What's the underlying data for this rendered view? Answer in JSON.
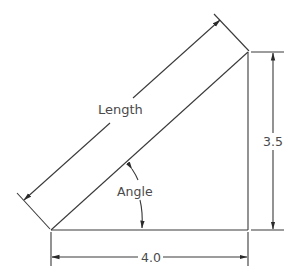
{
  "diagram": {
    "type": "right-triangle-dimension-drawing",
    "labels": {
      "hypotenuse": "Length",
      "angle": "Angle",
      "height": "3.5",
      "base": "4.0"
    },
    "colors": {
      "line": "#3a3a3a",
      "text": "#4a4a4a",
      "background": "#ffffff"
    }
  }
}
